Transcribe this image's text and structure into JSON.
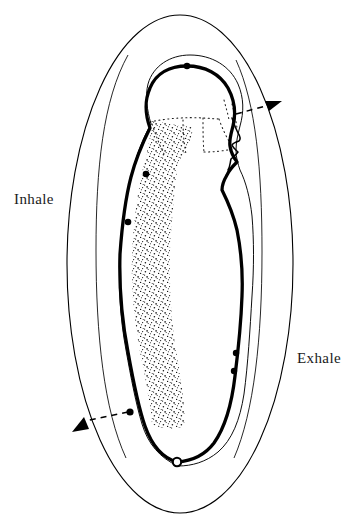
{
  "figure": {
    "background_color": "#ffffff",
    "ink_color": "#000000",
    "labels": {
      "inhale": "Inhale",
      "exhale": "Exhale"
    },
    "annotations": {
      "inhale_arrow": "dashed-arrow-down-left",
      "exhale_arrow": "dashed-arrow-up-right",
      "start_marker": "open-circle-at-base-of-spine",
      "body_markers": "filled-dots-along-body-outline"
    },
    "marker_dots": [
      {
        "name": "crown-of-head",
        "x": 187,
        "y": 66
      },
      {
        "name": "base-of-skull",
        "x": 144,
        "y": 173
      },
      {
        "name": "upper-back",
        "x": 127,
        "y": 221
      },
      {
        "name": "lower-back",
        "x": 130,
        "y": 412
      },
      {
        "name": "front-lower-torso-upper",
        "x": 235,
        "y": 354
      },
      {
        "name": "front-lower-torso-lower",
        "x": 233,
        "y": 370
      }
    ],
    "open_marker": {
      "name": "perineum-start-point",
      "x": 177,
      "y": 462
    },
    "outer_ellipse": {
      "cx": 180,
      "cy": 264,
      "rx": 113,
      "ry": 249
    },
    "inner_ellipse": {
      "cx": 181,
      "cy": 266,
      "rx": 78,
      "ry": 212
    },
    "colors": {
      "line": "#000000",
      "text": "#1a1a1a",
      "background": "#ffffff"
    }
  }
}
